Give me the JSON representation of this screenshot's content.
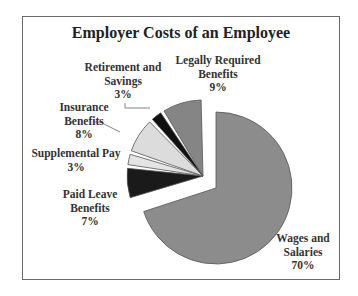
{
  "chart_data": {
    "type": "pie",
    "title": "Employer Costs of an Employee",
    "categories": [
      "Wages and Salaries",
      "Paid Leave Benefits",
      "Supplemental Pay",
      "Insurance Benefits",
      "Retirement and Savings",
      "Legally Required Benefits"
    ],
    "values": [
      70,
      7,
      3,
      8,
      3,
      9
    ],
    "unit": "%",
    "exploded": [
      "Paid Leave Benefits",
      "Supplemental Pay",
      "Insurance Benefits",
      "Retirement and Savings",
      "Legally Required Benefits"
    ],
    "colors": [
      "#8c8c8c",
      "#1a1a1a",
      "#e4e4e4",
      "#dcdcdc",
      "#111111",
      "#858585"
    ],
    "legend": "none (direct labels)"
  },
  "labels": {
    "title": "Employer Costs of an Employee",
    "wages": {
      "line1": "Wages and",
      "line2": "Salaries",
      "pct": "70%"
    },
    "paid_leave": {
      "line1": "Paid Leave",
      "line2": "Benefits",
      "pct": "7%"
    },
    "supplemental": {
      "line1": "Supplemental Pay",
      "pct": "3%"
    },
    "insurance": {
      "line1": "Insurance",
      "line2": "Benefits",
      "pct": "8%"
    },
    "retirement": {
      "line1": "Retirement and",
      "line2": "Savings",
      "pct": "3%"
    },
    "legally": {
      "line1": "Legally Required",
      "line2": "Benefits",
      "pct": "9%"
    }
  }
}
